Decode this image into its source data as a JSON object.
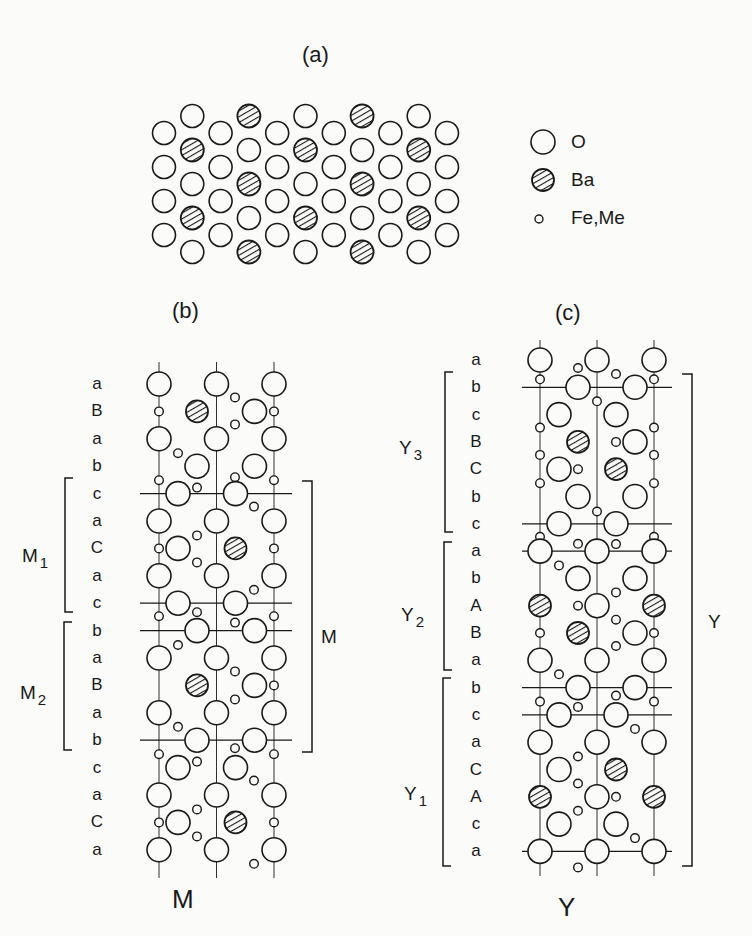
{
  "panels": {
    "a": {
      "title": "(a)",
      "legend": [
        {
          "symbol": "open-circle",
          "label": "O"
        },
        {
          "symbol": "hatched-circle",
          "label": "Ba"
        },
        {
          "symbol": "small-circle",
          "label": "Fe,Me"
        }
      ]
    },
    "b": {
      "title": "(b)",
      "caption": "M",
      "layers": [
        "a",
        "B",
        "a",
        "b",
        "c",
        "a",
        "C",
        "a",
        "c",
        "b",
        "a",
        "B",
        "a",
        "b",
        "c",
        "a",
        "C",
        "a"
      ],
      "blocks": [
        {
          "label": "M",
          "sub": "1",
          "from": 4,
          "to": 8
        },
        {
          "label": "M",
          "sub": "2",
          "from": 9,
          "to": 13
        }
      ],
      "unit_label": "M"
    },
    "c": {
      "title": "(c)",
      "caption": "Y",
      "layers": [
        "a",
        "b",
        "c",
        "B",
        "C",
        "b",
        "c",
        "a",
        "b",
        "A",
        "B",
        "a",
        "b",
        "c",
        "a",
        "C",
        "A",
        "c",
        "a"
      ],
      "blocks": [
        {
          "label": "Y",
          "sub": "3",
          "from": 1,
          "to": 6
        },
        {
          "label": "Y",
          "sub": "2",
          "from": 7,
          "to": 12
        },
        {
          "label": "Y",
          "sub": "1",
          "from": 13,
          "to": 18
        }
      ],
      "unit_label": "Y"
    }
  },
  "colors": {
    "ink": "#1a1a1a",
    "background": "#fbfbf9"
  }
}
